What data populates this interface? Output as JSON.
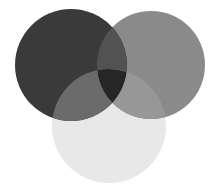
{
  "diagram": {
    "type": "venn",
    "sets": [
      {
        "name": "circle-left",
        "cx": 71,
        "cy": 65,
        "r": 56,
        "fill": "#3a3a3a",
        "opacity": 1
      },
      {
        "name": "circle-right",
        "cx": 151,
        "cy": 65,
        "r": 54,
        "fill": "#8a8a8a",
        "opacity": 0.92
      },
      {
        "name": "circle-bottom",
        "cx": 109,
        "cy": 126,
        "r": 57,
        "fill": "#e6e6e6",
        "opacity": 0.55
      }
    ],
    "colors": {
      "background": "#ffffff",
      "left": "#3a3a3a",
      "right": "#8a8a8a",
      "bottom": "#e8e8e8",
      "left_right_overlap": "#4e4e4e",
      "center_overlap": "#262626",
      "left_bottom_overlap": "#6a6a6a",
      "right_bottom_overlap": "#939393"
    }
  }
}
